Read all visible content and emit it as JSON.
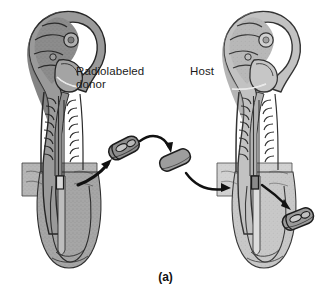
{
  "figure": {
    "caption": "(a)",
    "labels": {
      "donor": "Radiolabeled\ndonor",
      "host": "Host"
    },
    "colors": {
      "background": "#ffffff",
      "ink": "#1a1a1a",
      "donor_body_fill": "#9a9a9a",
      "donor_body_shade": "#7d7d7d",
      "host_body_fill": "#c2c2c2",
      "host_body_shade": "#a8a8a8",
      "outline": "#2b2b2b",
      "graft_donor_fill": "#8d8d8d",
      "graft_host_fill": "#9d9d9d",
      "arrow": "#111111",
      "leader": "#f2f2f2"
    }
  },
  "diagram": {
    "type": "embryo-graft-schematic",
    "elements": [
      {
        "name": "donor-embryo",
        "role": "radiolabeled donor embryo",
        "side": "left",
        "shade": "dark",
        "parts": [
          "cranial-flexure",
          "optic-vesicle",
          "otic-vesicle",
          "heart-bulge",
          "somites",
          "neural-tube",
          "body-wall-flange",
          "tail-bud"
        ]
      },
      {
        "name": "host-embryo",
        "role": "host embryo",
        "side": "right",
        "shade": "light",
        "parts": [
          "cranial-flexure",
          "optic-vesicle",
          "otic-vesicle",
          "heart-bulge",
          "somites",
          "neural-tube",
          "body-wall-flange",
          "tail-bud"
        ]
      },
      {
        "name": "donor-graft-segment",
        "role": "excised labeled neural tube segment from donor",
        "detail": "internal lumen ovals"
      },
      {
        "name": "host-graft-segment",
        "role": "host neural tube segment removed to make space",
        "detail": "plain solid"
      },
      {
        "name": "excised-host-segment",
        "role": "host segment discarded after graft inserted",
        "detail": "internal lumen ovals"
      }
    ],
    "arrows": [
      {
        "name": "arrow-donor-excision",
        "from": "donor-embryo graft site",
        "to": "donor-graft-segment"
      },
      {
        "name": "arrow-donor-transfer",
        "from": "donor-graft-segment",
        "to": "host-graft-segment position"
      },
      {
        "name": "arrow-graft-insertion",
        "from": "host-graft-segment",
        "to": "host-embryo graft site"
      },
      {
        "name": "arrow-host-removal",
        "from": "host-embryo graft site",
        "to": "excised-host-segment"
      }
    ],
    "leader_lines": [
      {
        "name": "leader-donor-label",
        "from": "Radiolabeled donor label",
        "to": "donor embryo heart region"
      },
      {
        "name": "leader-host-label",
        "from": "Host label",
        "to": "host embryo heart region"
      }
    ]
  }
}
